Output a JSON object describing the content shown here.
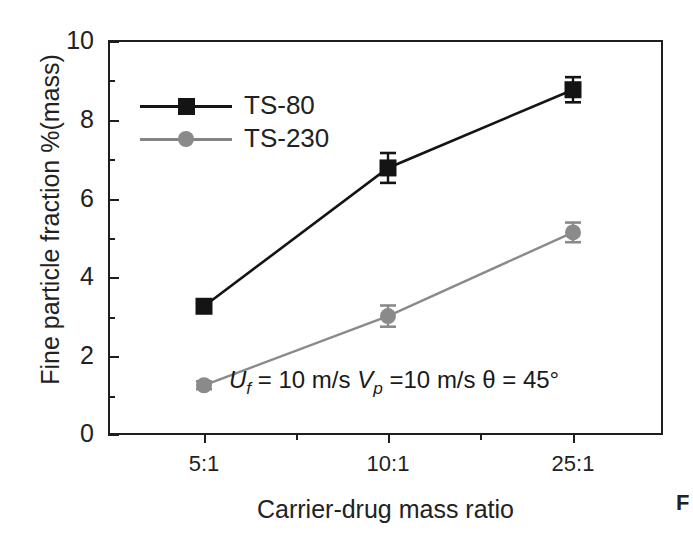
{
  "chart_data": {
    "type": "line",
    "title": "",
    "subtitle": "",
    "xlabel": "Carrier-drug mass ratio",
    "ylabel": "Fine particle fraction %(mass)",
    "categories": [
      "5:1",
      "10:1",
      "25:1"
    ],
    "xtick_labels": [
      "5:1",
      "10:1",
      "25:1"
    ],
    "ytick_labels": [
      "0",
      "2",
      "4",
      "6",
      "8",
      "10"
    ],
    "ylim": [
      0,
      10
    ],
    "yticks": [
      0,
      2,
      4,
      6,
      8,
      10
    ],
    "y_minor_ticks": [
      1,
      3,
      5,
      7,
      9
    ],
    "grid": false,
    "legend_position": "upper-left-inside",
    "series": [
      {
        "name": "TS-80",
        "marker": "square",
        "color": "#141414",
        "values": [
          3.25,
          6.77,
          8.76
        ],
        "errors": [
          0.12,
          0.38,
          0.32
        ]
      },
      {
        "name": "TS-230",
        "marker": "circle",
        "color": "#8a8a8a",
        "values": [
          1.24,
          3.0,
          5.13
        ],
        "errors": [
          0.1,
          0.27,
          0.25
        ]
      }
    ],
    "annotations": [
      {
        "id": "conditions",
        "text": "Uf = 10 m/s Vp =10 m/s θ = 45°",
        "parts": {
          "u_symbol": "U",
          "u_sub": "f",
          "u_value": " = 10 m/s ",
          "v_symbol": "V",
          "v_sub": "p",
          "v_value": " =10 m/s ",
          "theta": "θ = 45°"
        }
      }
    ]
  },
  "legend": {
    "items": [
      {
        "label": "TS-80",
        "marker": "square-marker",
        "color": "#141414"
      },
      {
        "label": "TS-230",
        "marker": "circle-marker",
        "color": "#8a8a8a"
      }
    ]
  },
  "axes": {
    "y_title": "Fine particle fraction %(mass)",
    "x_title": "Carrier-drug mass ratio",
    "y_ticks": [
      "10",
      "8",
      "6",
      "4",
      "2",
      "0"
    ],
    "x_ticks": [
      "5:1",
      "10:1",
      "25:1"
    ]
  },
  "caption": {
    "fragment": "F"
  },
  "colors": {
    "series_dark": "#141414",
    "series_gray": "#8a8a8a",
    "axis": "#1e1e1e",
    "text": "#222222",
    "background": "#ffffff"
  }
}
